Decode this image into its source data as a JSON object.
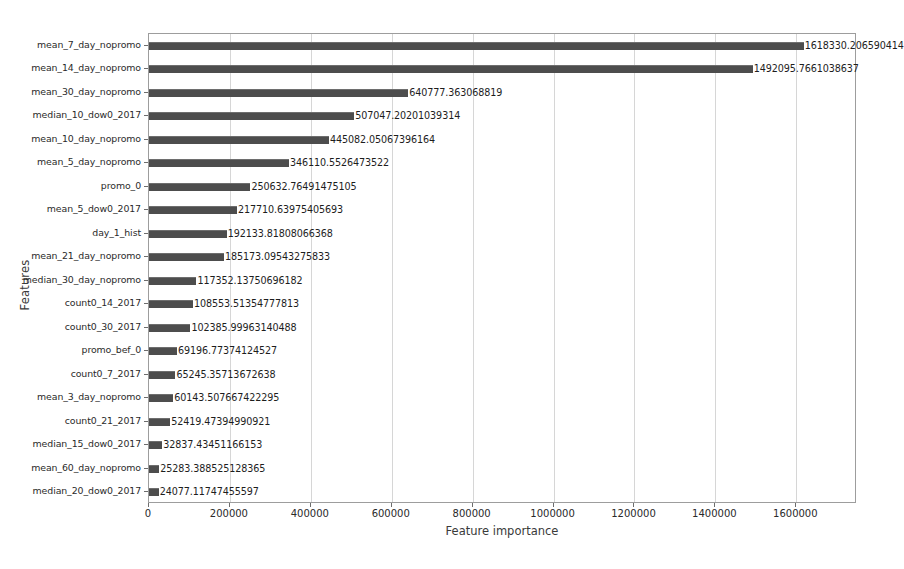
{
  "chart_data": {
    "type": "bar",
    "orientation": "horizontal",
    "title": "",
    "xlabel": "Feature importance",
    "ylabel": "Features",
    "xlim": [
      0,
      1750000
    ],
    "ylim": [
      0,
      20
    ],
    "grid": true,
    "legend": null,
    "bar_color": "#4d4d4d",
    "xticks": [
      0,
      200000,
      400000,
      600000,
      800000,
      1000000,
      1200000,
      1400000,
      1600000
    ],
    "xtick_labels": [
      "0",
      "200000",
      "400000",
      "600000",
      "800000",
      "1000000",
      "1200000",
      "1400000",
      "1600000"
    ],
    "categories": [
      "mean_7_day_nopromo",
      "mean_14_day_nopromo",
      "mean_30_day_nopromo",
      "median_10_dow0_2017",
      "mean_10_day_nopromo",
      "mean_5_day_nopromo",
      "promo_0",
      "mean_5_dow0_2017",
      "day_1_hist",
      "mean_21_day_nopromo",
      "median_30_day_nopromo",
      "count0_14_2017",
      "count0_30_2017",
      "promo_bef_0",
      "count0_7_2017",
      "mean_3_day_nopromo",
      "count0_21_2017",
      "median_15_dow0_2017",
      "mean_60_day_nopromo",
      "median_20_dow0_2017"
    ],
    "values": [
      1618330.206590414,
      1492095.7661038637,
      640777.363068819,
      507047.20201039314,
      445082.05067396164,
      346110.5526473522,
      250632.76491475105,
      217710.63975405693,
      192133.81808066368,
      185173.09543275833,
      117352.13750696182,
      108553.51354777813,
      102385.99963140488,
      69196.77374124527,
      65245.35713672638,
      60143.507667422295,
      52419.47394990921,
      32837.43451166153,
      25283.388525128365,
      24077.11747455597
    ],
    "value_labels": [
      "1618330.206590414",
      "1492095.7661038637",
      "640777.363068819",
      "507047.20201039314",
      "445082.05067396164",
      "346110.5526473522",
      "250632.76491475105",
      "217710.63975405693",
      "192133.81808066368",
      "185173.09543275833",
      "117352.13750696182",
      "108553.51354777813",
      "102385.99963140488",
      "69196.77374124527",
      "65245.35713672638",
      "60143.507667422295",
      "52419.47394990921",
      "32837.43451166153",
      "25283.388525128365",
      "24077.11747455597"
    ]
  }
}
